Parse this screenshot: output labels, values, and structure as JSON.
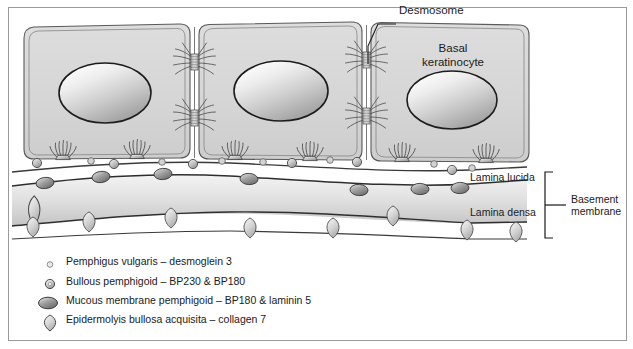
{
  "diagram": {
    "labels": {
      "desmosome": "Desmosome",
      "basal_keratinocyte": "Basal\nkeratinocyte",
      "basal_keratinocyte_line1": "Basal",
      "basal_keratinocyte_line2": "keratinocyte",
      "lamina_lucida": "Lamina lucida",
      "lamina_densa": "Lamina densa",
      "basement_membrane_line1": "Basement",
      "basement_membrane_line2": "membrane"
    },
    "structures": {
      "cell_count": 3,
      "desmosome_count": 4,
      "hemidesmosome_count": 6
    },
    "colors": {
      "frame_border": "#9a9a9a",
      "cell_fill": "#d6d6d6",
      "cell_outline": "#555555",
      "nucleus_light": "#f2f2f2",
      "nucleus_dark": "#9b9b9b",
      "nucleus_outline": "#1c1c1c",
      "lamina_band_light": "#eeeeee",
      "lamina_band_dark": "#c2c2c2",
      "membrane_line": "#3a3a3a",
      "text": "#1a1a1a",
      "marker_small_fill": "#c9c9c9",
      "marker_ring_fill": "#b9b9b9",
      "marker_dark_fill": "#8c8c8c",
      "marker_teardrop_fill": "#c6c6c6"
    }
  },
  "legend": {
    "items": [
      {
        "marker": "small-open-circle-marker",
        "text": "Pemphigus vulgaris – desmoglein 3",
        "disease": "Pemphigus vulgaris",
        "antigen": "desmoglein 3",
        "location": "desmosome"
      },
      {
        "marker": "ring-circle-marker",
        "text": "Bullous pemphigoid – BP230 & BP180",
        "disease": "Bullous pemphigoid",
        "antigen": "BP230 & BP180",
        "location": "hemidesmosome"
      },
      {
        "marker": "dark-ellipse-marker",
        "text": "Mucous membrane pemphigoid – BP180 & laminin 5",
        "disease": "Mucous membrane pemphigoid",
        "antigen": "BP180 & laminin 5",
        "location": "lamina lucida"
      },
      {
        "marker": "teardrop-marker",
        "text": "Epidermolyis bullosa acquisita – collagen 7",
        "disease": "Epidermolyis bullosa acquisita",
        "antigen": "collagen 7",
        "location": "lamina densa / sub-lamina densa"
      }
    ]
  }
}
